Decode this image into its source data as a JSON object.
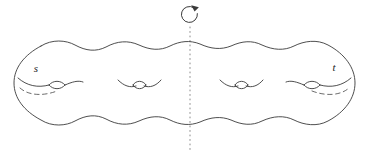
{
  "figure": {
    "background_color": "#ffffff",
    "stroke_color": "#3a3a3a",
    "hidden_stroke_color": "#5a5a5a",
    "axis_color": "#8a8a8a",
    "label_color": "#232323",
    "width": 380,
    "height": 155
  },
  "labels": {
    "left": "s",
    "right": "t"
  },
  "axis": {
    "name": "rotation-axis",
    "x": 190,
    "top_y": 27,
    "bottom_y": 152,
    "style": "dotted"
  },
  "rotation_marker": {
    "name": "rotation-arrow",
    "center_x": 190,
    "center_y": 15,
    "radius": 8,
    "direction": "clockwise"
  },
  "handles": [
    {
      "name": "handle-1",
      "cx": 57,
      "cy": 83,
      "labeled": "s",
      "has_hidden_arc": true
    },
    {
      "name": "handle-2",
      "cx": 139,
      "cy": 83,
      "labeled": "",
      "has_hidden_arc": false
    },
    {
      "name": "handle-3",
      "cx": 241,
      "cy": 83,
      "labeled": "",
      "has_hidden_arc": false
    },
    {
      "name": "handle-4",
      "cx": 323,
      "cy": 83,
      "labeled": "t",
      "has_hidden_arc": true
    }
  ],
  "genus": 4
}
